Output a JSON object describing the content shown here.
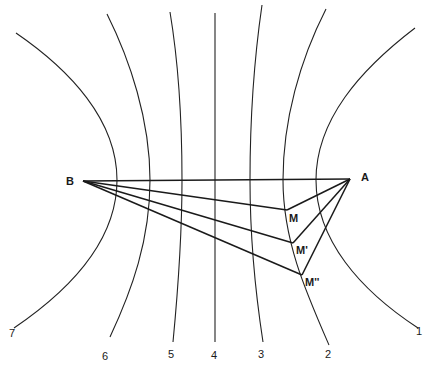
{
  "diagram": {
    "points": {
      "B": {
        "label": "B",
        "x": 83,
        "y": 181
      },
      "A": {
        "label": "A",
        "x": 350,
        "y": 179
      },
      "M": {
        "label": "M",
        "x": 287,
        "y": 210
      },
      "M1": {
        "label": "M'",
        "x": 293,
        "y": 243
      },
      "M2": {
        "label": "M''",
        "x": 302,
        "y": 275
      }
    },
    "curve_labels": [
      "7",
      "6",
      "5",
      "4",
      "3",
      "2",
      "1"
    ],
    "colors": {
      "stroke": "#222222",
      "background": "#ffffff"
    }
  }
}
